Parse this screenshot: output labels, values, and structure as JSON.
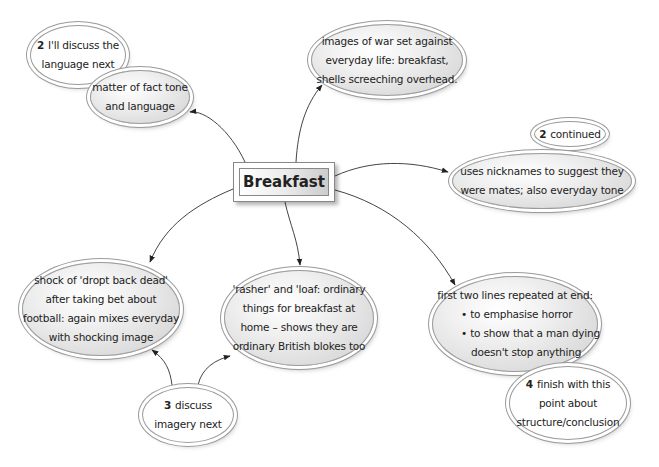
{
  "central_topic": "Breakfast",
  "nodes": {
    "language_note": {
      "number": "2",
      "lines": [
        "I'll discuss the",
        "language next"
      ]
    },
    "tone": {
      "lines": [
        "matter of fact tone",
        "and language"
      ]
    },
    "war_images": {
      "lines": [
        "images of war set against",
        "everyday life: breakfast,",
        "shells screeching overhead."
      ]
    },
    "continued_note": {
      "number": "2",
      "lines": [
        "continued"
      ]
    },
    "nicknames": {
      "lines": [
        "uses nicknames to suggest they",
        "were mates; also everyday tone"
      ]
    },
    "shock": {
      "lines": [
        "shock of 'dropt back dead'",
        "after taking bet about",
        "football: again mixes everyday",
        "with shocking image"
      ]
    },
    "rasher": {
      "lines": [
        "'rasher' and 'loaf: ordinary",
        "things for breakfast at",
        "home – shows they are",
        "ordinary British blokes too"
      ]
    },
    "repeated": {
      "lines": [
        "first two lines repeated at end:",
        "• to emphasise horror",
        "• to show that a man dying",
        "doesn't stop anything"
      ]
    },
    "imagery_note": {
      "number": "3",
      "lines": [
        "discuss",
        "imagery next"
      ]
    },
    "finish_note": {
      "number": "4",
      "lines": [
        "finish with this",
        "point about",
        "structure/conclusion"
      ]
    }
  }
}
